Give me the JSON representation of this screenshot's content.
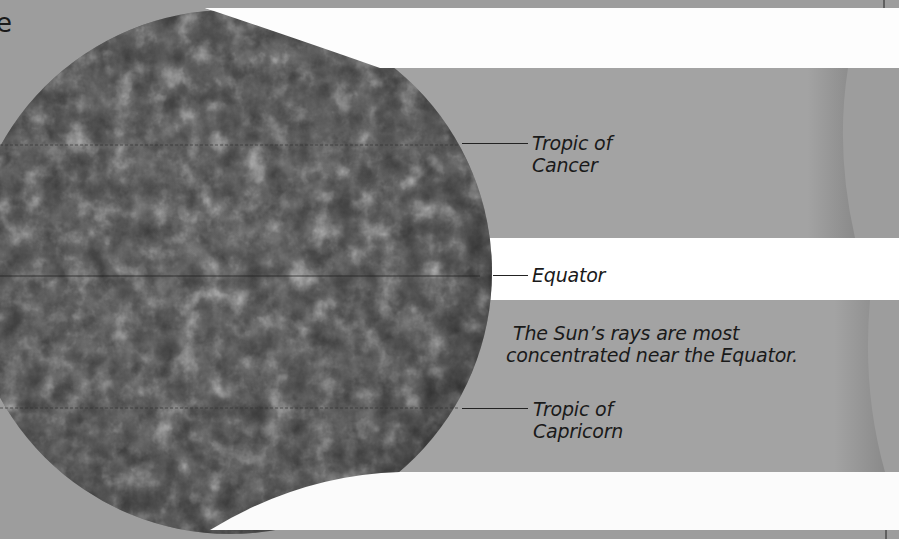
{
  "diagram": {
    "title_fragment": "e",
    "colors": {
      "background": "#9d9d9d",
      "band_gray": "#a3a3a3",
      "beam_white": "#ffffff",
      "text": "#1a1a1a"
    },
    "labels": {
      "tropic_cancer_line1": "Tropic of",
      "tropic_cancer_line2": "Cancer",
      "equator": "Equator",
      "caption_line1": "The Sun’s rays are most",
      "caption_line2": "concentrated near the Equator.",
      "tropic_capricorn_line1": "Tropic of",
      "tropic_capricorn_line2": "Capricorn"
    },
    "illustration": {
      "globe": "earth-satellite-image",
      "beams": [
        "sun-ray-beam-north",
        "sun-ray-beam-equator",
        "sun-ray-beam-south"
      ]
    }
  }
}
